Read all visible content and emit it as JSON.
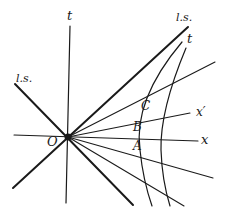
{
  "figure": {
    "type": "spacetime diagram",
    "origin_label": "O",
    "axes": {
      "t_axis_label": "t",
      "x_axis_label": "x",
      "x_prime_axis_label": "x′",
      "t_prime_curve_label": "t"
    },
    "light_signal_labels": {
      "upper_right": "l.s.",
      "upper_left": "l.s."
    },
    "points": {
      "A": "A",
      "B": "B",
      "C": "C"
    },
    "colors": {
      "ink": "#1a1a1a",
      "background": "#ffffff"
    }
  }
}
